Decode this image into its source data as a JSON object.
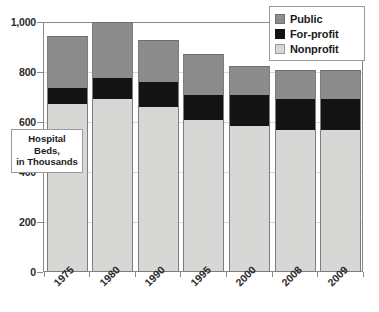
{
  "chart_data": {
    "type": "bar",
    "subtype": "stacked-bar",
    "title": "",
    "xlabel": "",
    "ylabel": "Hospital Beds, in Thousands",
    "categories": [
      "1975",
      "1980",
      "1990",
      "1995",
      "2000",
      "2008",
      "2009"
    ],
    "series": [
      {
        "name": "Nonprofit",
        "color": "#d7d7d5",
        "values": [
          672,
          692,
          660,
          608,
          584,
          568,
          568
        ]
      },
      {
        "name": "For-profit",
        "color": "#141414",
        "values": [
          64,
          84,
          100,
          100,
          124,
          124,
          124
        ]
      },
      {
        "name": "Public",
        "color": "#8c8c8c",
        "values": [
          208,
          224,
          168,
          164,
          116,
          116,
          116
        ]
      }
    ],
    "totals": [
      944,
      1000,
      928,
      872,
      824,
      808,
      808
    ],
    "ylim": [
      0,
      1000
    ],
    "yticks": [
      0,
      200,
      400,
      600,
      800,
      1000
    ],
    "ytick_labels": [
      "0",
      "200",
      "400",
      "600",
      "800",
      "1,000"
    ],
    "grid": true,
    "legend_position": "top-right"
  },
  "axis_title": {
    "line1": "Hospital",
    "line2": "Beds,",
    "line3": "in Thousands"
  },
  "legend": {
    "items": [
      {
        "label": "Public",
        "swatch": "public-swatch"
      },
      {
        "label": "For-profit",
        "swatch": "for-profit-swatch"
      },
      {
        "label": "Nonprofit",
        "swatch": "nonprofit-swatch"
      }
    ]
  },
  "colors": {
    "public": "#8c8c8c",
    "for_profit": "#141414",
    "nonprofit": "#d7d7d5",
    "axis": "#8a8a8a",
    "grid": "#d8d8d8",
    "text": "#1b1b1b",
    "background": "#ffffff"
  }
}
